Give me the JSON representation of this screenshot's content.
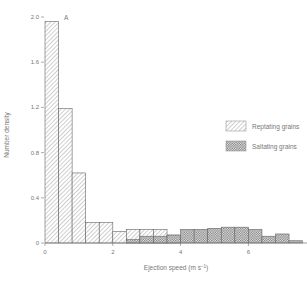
{
  "chart_data": {
    "type": "bar",
    "title": "",
    "panel_label": "A",
    "xlabel": "Ejection speed (m s⁻¹)",
    "ylabel": "Number density",
    "xlim": [
      0,
      8
    ],
    "ylim": [
      0,
      2.0
    ],
    "bin_width": 0.4,
    "x_ticks": [
      "0",
      "2",
      "4",
      "6",
      "8"
    ],
    "y_ticks": [
      "0",
      "0.4",
      "0.8",
      "1.2",
      "1.6",
      "2.0"
    ],
    "grid": false,
    "legend_position": "right",
    "series": [
      {
        "name": "Reptating grains",
        "pattern": "diagonal-hatch",
        "bin_starts": [
          0.0,
          0.4,
          0.8,
          1.2,
          1.6,
          2.0,
          2.4,
          2.8,
          3.2,
          3.6
        ],
        "values": [
          1.96,
          1.19,
          0.62,
          0.18,
          0.18,
          0.1,
          0.12,
          0.12,
          0.12,
          0.07
        ]
      },
      {
        "name": "Saltating grains",
        "pattern": "cross-hatch",
        "bin_starts": [
          2.4,
          2.8,
          3.2,
          3.6,
          4.0,
          4.4,
          4.8,
          5.2,
          5.6,
          6.0,
          6.4,
          6.8,
          7.2
        ],
        "values": [
          0.03,
          0.06,
          0.06,
          0.07,
          0.12,
          0.12,
          0.13,
          0.14,
          0.14,
          0.12,
          0.06,
          0.08,
          0.02
        ]
      }
    ]
  },
  "legend": {
    "reptating": "Reptating grains",
    "saltating": "Saltating grains"
  },
  "labels": {
    "panel": "A",
    "xlabel": "Ejection speed (m s",
    "xlabel_sup": "−1",
    "xlabel_end": ")",
    "ylabel": "Number density",
    "right_edge": "(B"
  }
}
